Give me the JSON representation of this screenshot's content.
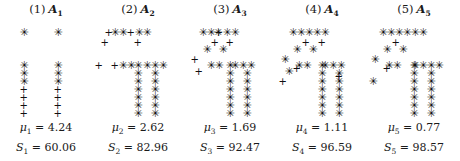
{
  "figure": {
    "type": "scatter-panels",
    "background": "#ffffff",
    "marker_color": "#101010",
    "panel_count": 5,
    "marker_glyphs": {
      "star": "✳",
      "plus": "+"
    },
    "marker_names": {
      "star": "asterisk-marker",
      "plus": "plus-marker"
    }
  },
  "panels": [
    {
      "index_label": "(1)",
      "matrix_label": "A",
      "matrix_sub": "1",
      "mu_label": "μ",
      "mu_sub": "1",
      "mu_value": "4.24",
      "s_label": "S",
      "s_sub": "1",
      "s_value": "60.06",
      "mu_text": "μ₁ = 4.24",
      "s_text": "S₁ = 60.06"
    },
    {
      "index_label": "(2)",
      "matrix_label": "A",
      "matrix_sub": "2",
      "mu_label": "μ",
      "mu_sub": "2",
      "mu_value": "2.62",
      "s_label": "S",
      "s_sub": "2",
      "s_value": "82.96",
      "mu_text": "μ₂ = 2.62",
      "s_text": "S₂ = 82.96"
    },
    {
      "index_label": "(3)",
      "matrix_label": "A",
      "matrix_sub": "3",
      "mu_label": "μ",
      "mu_sub": "3",
      "mu_value": "1.69",
      "s_label": "S",
      "s_sub": "3",
      "s_value": "92.47",
      "mu_text": "μ₃ = 1.69",
      "s_text": "S₃ = 92.47"
    },
    {
      "index_label": "(4)",
      "matrix_label": "A",
      "matrix_sub": "4",
      "mu_label": "μ",
      "mu_sub": "4",
      "mu_value": "1.11",
      "s_label": "S",
      "s_sub": "4",
      "s_value": "96.59",
      "mu_text": "μ₄ = 1.11",
      "s_text": "S₄ = 96.59"
    },
    {
      "index_label": "(5)",
      "matrix_label": "A",
      "matrix_sub": "5",
      "mu_label": "μ",
      "mu_sub": "5",
      "mu_value": "0.77",
      "s_label": "S",
      "s_sub": "5",
      "s_value": "98.57",
      "mu_text": "μ₅ = 0.77",
      "s_text": "S₅ = 98.57"
    }
  ],
  "chart_data": {
    "type": "scatter",
    "title": "",
    "xlabel": "",
    "ylabel": "",
    "grid": false,
    "legend": "none",
    "note": "Five scatter panels. Each panel contains two T-shaped point clouds drawn with two marker types: '*' (asterisk) and '+' (plus). Coordinates below are in panel-local pixel units (origin top-left of the 92x90 plot box).",
    "panels": [
      {
        "name": "A1",
        "mu": 4.24,
        "S": 60.06,
        "series": [
          {
            "name": "star",
            "marker": "*",
            "points": [
              [
                23,
                6
              ],
              [
                23,
                39
              ],
              [
                23,
                47
              ],
              [
                23,
                55
              ],
              [
                57,
                6
              ],
              [
                57,
                39
              ],
              [
                57,
                47
              ],
              [
                57,
                55
              ]
            ]
          },
          {
            "name": "plus",
            "marker": "+",
            "points": [
              [
                23,
                63
              ],
              [
                23,
                71
              ],
              [
                23,
                79
              ],
              [
                23,
                87
              ],
              [
                57,
                63
              ],
              [
                57,
                71
              ],
              [
                57,
                79
              ],
              [
                57,
                87
              ]
            ]
          }
        ]
      },
      {
        "name": "A2",
        "mu": 2.62,
        "S": 82.96,
        "series": [
          {
            "name": "star",
            "marker": "*",
            "points": [
              [
                45,
                39
              ],
              [
                45,
                47
              ],
              [
                45,
                55
              ],
              [
                45,
                63
              ],
              [
                45,
                71
              ],
              [
                45,
                79
              ],
              [
                45,
                87
              ],
              [
                22,
                6
              ],
              [
                30,
                6
              ],
              [
                46,
                6
              ],
              [
                54,
                6
              ],
              [
                30,
                39
              ],
              [
                38,
                39
              ],
              [
                54,
                39
              ],
              [
                62,
                39
              ],
              [
                70,
                39
              ],
              [
                62,
                47
              ],
              [
                62,
                55
              ],
              [
                62,
                63
              ],
              [
                62,
                71
              ],
              [
                62,
                79
              ],
              [
                62,
                87
              ]
            ]
          },
          {
            "name": "plus",
            "marker": "+",
            "points": [
              [
                16,
                6
              ],
              [
                12,
                16
              ],
              [
                6,
                39
              ],
              [
                22,
                39
              ],
              [
                38,
                6
              ],
              [
                45,
                16
              ]
            ]
          }
        ]
      },
      {
        "name": "A3",
        "mu": 1.69,
        "S": 92.47,
        "series": [
          {
            "name": "star",
            "marker": "*",
            "points": [
              [
                45,
                39
              ],
              [
                45,
                47
              ],
              [
                45,
                55
              ],
              [
                45,
                63
              ],
              [
                45,
                71
              ],
              [
                45,
                79
              ],
              [
                45,
                87
              ],
              [
                18,
                6
              ],
              [
                26,
                6
              ],
              [
                42,
                6
              ],
              [
                50,
                6
              ],
              [
                26,
                39
              ],
              [
                34,
                39
              ],
              [
                50,
                39
              ],
              [
                58,
                39
              ],
              [
                66,
                39
              ],
              [
                62,
                47
              ],
              [
                62,
                55
              ],
              [
                62,
                63
              ],
              [
                62,
                71
              ],
              [
                62,
                79
              ],
              [
                62,
                87
              ],
              [
                22,
                23
              ],
              [
                38,
                23
              ],
              [
                33,
                6
              ]
            ]
          },
          {
            "name": "plus",
            "marker": "+",
            "points": [
              [
                30,
                16
              ],
              [
                10,
                33
              ],
              [
                14,
                45
              ],
              [
                34,
                6
              ],
              [
                45,
                16
              ]
            ]
          }
        ]
      },
      {
        "name": "A4",
        "mu": 1.11,
        "S": 96.59,
        "series": [
          {
            "name": "star",
            "marker": "*",
            "points": [
              [
                45,
                39
              ],
              [
                45,
                47
              ],
              [
                45,
                55
              ],
              [
                45,
                63
              ],
              [
                45,
                71
              ],
              [
                45,
                79
              ],
              [
                45,
                87
              ],
              [
                16,
                6
              ],
              [
                24,
                6
              ],
              [
                40,
                6
              ],
              [
                48,
                6
              ],
              [
                22,
                39
              ],
              [
                30,
                39
              ],
              [
                48,
                39
              ],
              [
                56,
                39
              ],
              [
                64,
                39
              ],
              [
                62,
                47
              ],
              [
                62,
                55
              ],
              [
                62,
                63
              ],
              [
                62,
                71
              ],
              [
                62,
                79
              ],
              [
                62,
                87
              ],
              [
                20,
                23
              ],
              [
                36,
                23
              ],
              [
                32,
                6
              ],
              [
                8,
                33
              ],
              [
                12,
                45
              ]
            ]
          },
          {
            "name": "plus",
            "marker": "+",
            "points": [
              [
                29,
                16
              ],
              [
                20,
                42
              ],
              [
                6,
                55
              ],
              [
                45,
                16
              ],
              [
                62,
                50
              ]
            ]
          }
        ]
      },
      {
        "name": "A5",
        "mu": 0.77,
        "S": 98.57,
        "series": [
          {
            "name": "star",
            "marker": "*",
            "points": [
              [
                45,
                39
              ],
              [
                45,
                47
              ],
              [
                45,
                55
              ],
              [
                45,
                63
              ],
              [
                45,
                71
              ],
              [
                45,
                79
              ],
              [
                45,
                87
              ],
              [
                14,
                6
              ],
              [
                22,
                6
              ],
              [
                38,
                6
              ],
              [
                46,
                6
              ],
              [
                20,
                39
              ],
              [
                28,
                39
              ],
              [
                46,
                39
              ],
              [
                54,
                39
              ],
              [
                62,
                39
              ],
              [
                62,
                47
              ],
              [
                62,
                55
              ],
              [
                62,
                63
              ],
              [
                62,
                71
              ],
              [
                62,
                79
              ],
              [
                62,
                87
              ],
              [
                18,
                23
              ],
              [
                34,
                23
              ],
              [
                30,
                6
              ],
              [
                6,
                33
              ],
              [
                4,
                55
              ],
              [
                54,
                6
              ],
              [
                70,
                39
              ]
            ]
          },
          {
            "name": "plus",
            "marker": "+",
            "points": [
              [
                27,
                16
              ],
              [
                18,
                42
              ]
            ]
          }
        ]
      }
    ]
  }
}
